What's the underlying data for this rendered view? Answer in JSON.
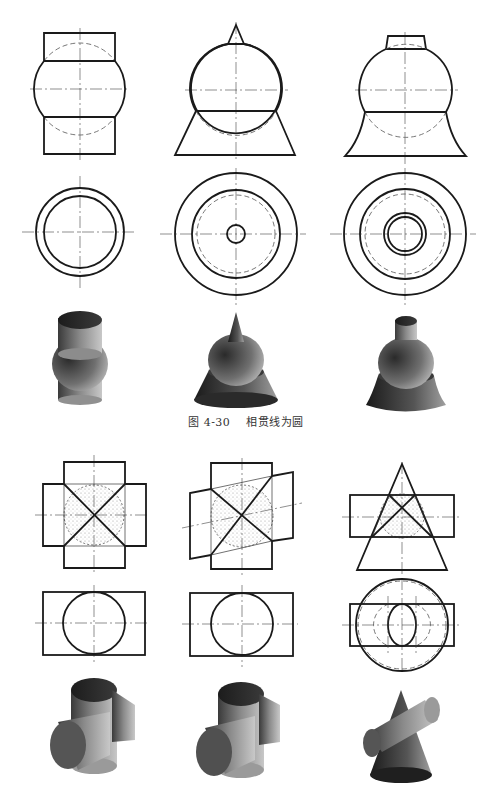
{
  "figure": {
    "caption_number": "图 4-30",
    "caption_title": "相贯线为圆"
  },
  "groups": [
    {
      "name": "coaxial-intersections",
      "description": "Intersection lines are circles (coaxial solids of revolution)",
      "items": [
        {
          "label": "cylinder-sphere",
          "views": [
            "front",
            "top",
            "shaded-3d"
          ]
        },
        {
          "label": "cone-sphere-frustum",
          "views": [
            "front",
            "top",
            "shaded-3d"
          ]
        },
        {
          "label": "frustum-sphere-curved-base",
          "views": [
            "front",
            "top",
            "shaded-3d"
          ]
        }
      ]
    },
    {
      "name": "cylinder-intersections",
      "description": "Cylinders sharing inscribed sphere; intersection projects as straight lines",
      "items": [
        {
          "label": "cylinder-cross-perpendicular",
          "views": [
            "front",
            "top",
            "shaded-3d"
          ]
        },
        {
          "label": "cylinder-cross-oblique",
          "views": [
            "front",
            "top",
            "shaded-3d"
          ]
        },
        {
          "label": "cone-cylinder",
          "views": [
            "front",
            "top",
            "shaded-3d"
          ]
        }
      ]
    }
  ],
  "colors": {
    "line": "#1a1a1a",
    "background": "#ffffff",
    "shade_dark": "#1e1e1e",
    "shade_light": "#b0b0b0"
  }
}
